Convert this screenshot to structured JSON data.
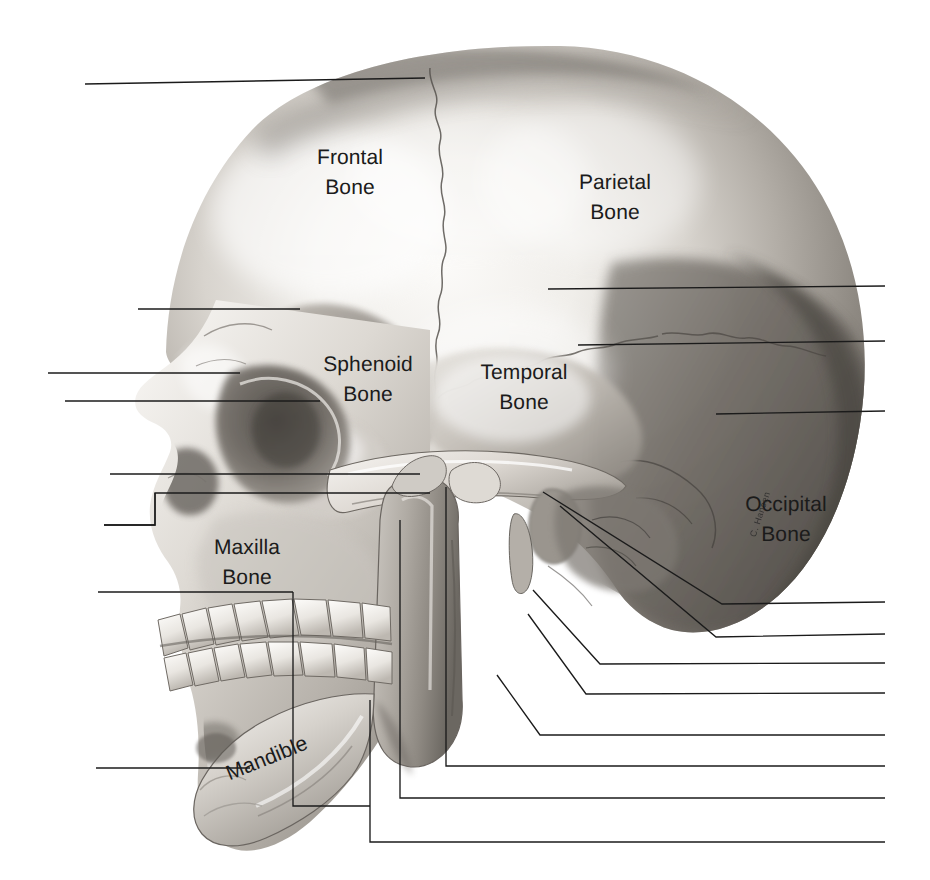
{
  "figure": {
    "type": "anatomical-illustration",
    "style": "grayscale halftone pencil rendering",
    "orientation": "left lateral, face pointing left",
    "background_color": "#ffffff",
    "line_color": "#1b1b1b",
    "text_color": "#1b1b1b"
  },
  "labels": {
    "frontal": {
      "line1": "Frontal",
      "line2": "Bone",
      "text": "Frontal\nBone"
    },
    "parietal": {
      "line1": "Parietal",
      "line2": "Bone",
      "text": "Parietal\nBone"
    },
    "sphenoid": {
      "line1": "Sphenoid",
      "line2": "Bone",
      "text": "Sphenoid\nBone"
    },
    "temporal": {
      "line1": "Temporal",
      "line2": "Bone",
      "text": "Temporal\nBone"
    },
    "occipital": {
      "line1": "Occipital",
      "line2": "Bone",
      "text": "Occipital\nBone"
    },
    "maxilla": {
      "line1": "Maxilla",
      "line2": "Bone",
      "text": "Maxilla\nBone"
    },
    "mandible": {
      "line1": "Mandible",
      "line2": "",
      "text": "Mandible"
    }
  },
  "signature": {
    "text": "C. Hansen"
  },
  "leader_lines": {
    "note": "Blank callout rules with no captions — worksheet style",
    "count": 18,
    "left_count": 6,
    "right_count": 8,
    "bottom_count": 4
  },
  "colors": {
    "ink": "#1b1b1b",
    "paper": "#ffffff",
    "bone_light": "#f2f0ec",
    "bone_mid": "#bdb9b2",
    "bone_shadow": "#8d8881",
    "bone_dark": "#5d5954",
    "deep_shadow": "#3c3935"
  }
}
